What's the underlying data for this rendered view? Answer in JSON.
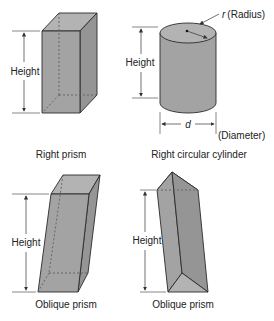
{
  "figures": {
    "right_prism": {
      "caption": "Right prism",
      "dimension_label": "Height"
    },
    "right_circular_cylinder": {
      "caption": "Right circular cylinder",
      "dimension_label": "Height",
      "radius_symbol": "r",
      "radius_label": "(Radius)",
      "diameter_symbol": "d",
      "diameter_label": "(Diameter)"
    },
    "oblique_prism_rectangular": {
      "caption": "Oblique prism",
      "dimension_label": "Height"
    },
    "oblique_prism_triangular": {
      "caption": "Oblique prism",
      "dimension_label": "Height"
    }
  },
  "colors": {
    "solid_fill": "#a3a3a3",
    "outline": "#2a2a2a",
    "hidden_edge": "#4a5a6a",
    "text": "#222222"
  }
}
